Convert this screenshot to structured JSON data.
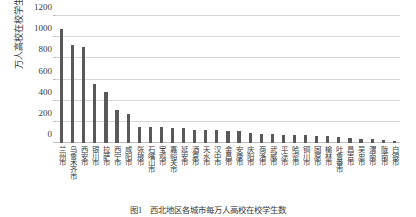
{
  "chart_data": {
    "type": "bar",
    "title": "",
    "xlabel": "",
    "ylabel": "万人高校在校学生数（人）",
    "ylim": [
      0,
      1200
    ],
    "yticks": [
      0,
      200,
      400,
      600,
      800,
      1000,
      1200
    ],
    "grid": true,
    "legend": "none",
    "bar_color": "#595959",
    "categories": [
      "兰州市",
      "乌鲁木齐市",
      "西安市",
      "银川市",
      "拉萨市",
      "西宁市",
      "咸阳市",
      "张掖市",
      "石嘴山市",
      "宝鸡市",
      "嘉峪关市",
      "延安市",
      "酒泉市",
      "天水市",
      "汉中市",
      "金昌市",
      "安康市",
      "庆阳市",
      "商洛市",
      "武威市",
      "平凉市",
      "哈密市",
      "铜川市",
      "固原市",
      "榆林市",
      "吐鲁番市",
      "昌吉市",
      "吴忠市",
      "渭南市",
      "陇南市",
      "白银市"
    ],
    "values": [
      1080,
      930,
      905,
      555,
      480,
      315,
      275,
      155,
      150,
      148,
      143,
      140,
      125,
      122,
      120,
      118,
      112,
      95,
      88,
      85,
      80,
      75,
      72,
      68,
      62,
      55,
      50,
      42,
      35,
      28,
      20
    ]
  },
  "caption": "图1　西北地区各城市每万人高校在校学生数"
}
